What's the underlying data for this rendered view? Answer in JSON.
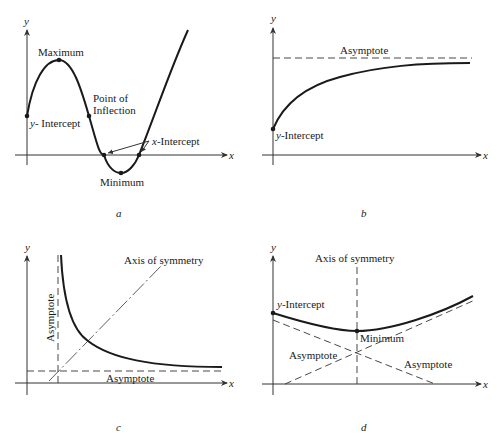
{
  "panels": {
    "a": {
      "caption": "a",
      "axis_x": "x",
      "axis_y": "y",
      "labels": {
        "maximum": "Maximum",
        "inflection_line1": "Point of",
        "inflection_line2": "Inflection",
        "y_intercept_var": "y",
        "y_intercept_rest": "- Intercept",
        "x_intercept_var": "x",
        "x_intercept_rest": "-Intercept",
        "minimum": "Minimum"
      }
    },
    "b": {
      "caption": "b",
      "axis_x": "x",
      "axis_y": "y",
      "labels": {
        "asymptote": "Asymptote",
        "y_intercept_var": "y",
        "y_intercept_rest": "-Intercept"
      }
    },
    "c": {
      "caption": "c",
      "axis_x": "x",
      "axis_y": "y",
      "labels": {
        "axis_of_symmetry": "Axis of symmetry",
        "asymptote_vertical": "Asymptote",
        "asymptote_horizontal": "Asymptote"
      }
    },
    "d": {
      "caption": "d",
      "axis_x": "x",
      "axis_y": "y",
      "labels": {
        "axis_of_symmetry": "Axis of symmetry",
        "y_intercept_var": "y",
        "y_intercept_rest": "-Intercept",
        "minimum": "Minimum",
        "asymptote_left": "Asymptote",
        "asymptote_right": "Asymptote"
      }
    }
  }
}
